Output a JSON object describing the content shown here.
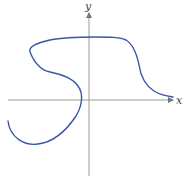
{
  "diagram": {
    "type": "curve-on-axes",
    "axes": {
      "x_label": "x",
      "y_label": "y",
      "origin": [
        89,
        100
      ],
      "x_axis": {
        "from": [
          8,
          100
        ],
        "to": [
          174,
          100
        ]
      },
      "y_axis": {
        "from": [
          89,
          176
        ],
        "to": [
          89,
          12
        ]
      }
    },
    "curve": {
      "color": "#3a56a8",
      "description": "Non-function curve: starts lower-left, loops down and up through the x-axis left of origin, bends into an S shape, crosses the y-axis near the top, then descends toward the x-axis on the right"
    },
    "colors": {
      "axis": "#9a9a9a",
      "curve": "#3a56a8",
      "label": "#444444"
    }
  }
}
